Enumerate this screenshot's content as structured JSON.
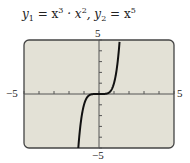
{
  "chart_data": {
    "type": "line",
    "xlabel": "",
    "ylabel": "",
    "xlim": [
      -5,
      5
    ],
    "ylim": [
      -5,
      5
    ],
    "x_tick_step": 1,
    "y_tick_step": 1,
    "grid": false,
    "legend": null,
    "tick_labels": {
      "x_min": "−5",
      "x_max": "5",
      "y_min": "−5",
      "y_max": "5"
    },
    "series": [
      {
        "name": "y1 = y2 = x^5",
        "x": [
          -1.38,
          -1.2,
          -1.0,
          -0.8,
          -0.5,
          0,
          0.5,
          0.8,
          1.0,
          1.2,
          1.38
        ],
        "values": [
          -5,
          -2.49,
          -1,
          -0.33,
          -0.03,
          0,
          0.03,
          0.33,
          1,
          2.49,
          5
        ]
      }
    ],
    "background_color": "#e3e1d6",
    "curve_color": "#111111"
  },
  "labels": {
    "title_y1": "y",
    "title_sub1": "1",
    "title_eq1": " = x",
    "title_sup1": "3",
    "title_dot": " · x",
    "title_sup2": "2",
    "title_comma": ",  y",
    "title_sub2": "2",
    "title_eq2": " = x",
    "title_sup3": "5",
    "y_max": "5",
    "y_min": "−5",
    "x_min": "−5",
    "x_max": "5"
  }
}
